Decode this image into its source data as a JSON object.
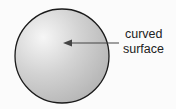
{
  "diagram": {
    "shape": "sphere",
    "label_line1": "curved",
    "label_line2": "surface",
    "colors": {
      "fill_light": "#f4f4f4",
      "fill_dark": "#b8b8b8",
      "outline": "#1a1a1a",
      "arrow": "#444444"
    }
  }
}
